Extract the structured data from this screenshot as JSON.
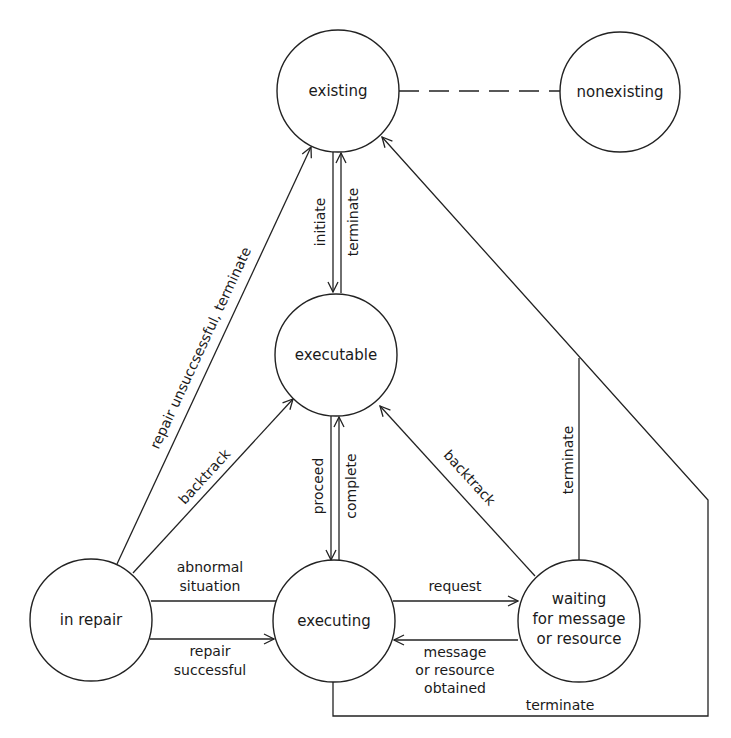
{
  "diagram": {
    "title": "",
    "colors": {
      "line": "#222222",
      "background": "#ffffff",
      "text": "#1a1a1a"
    },
    "nodes": {
      "existing": {
        "label": "existing"
      },
      "nonexisting": {
        "label": "nonexisting"
      },
      "executable": {
        "label": "executable"
      },
      "in_repair": {
        "label": "in repair"
      },
      "executing": {
        "label": "executing"
      },
      "waiting": {
        "line1": "waiting",
        "line2": "for message",
        "line3": "or resource"
      }
    },
    "edges": {
      "existing_nonexisting": {
        "style": "dashed",
        "label": ""
      },
      "initiate": {
        "from": "existing",
        "to": "executable",
        "label": "initiate"
      },
      "terminate_executable": {
        "from": "executable",
        "to": "existing",
        "label": "terminate"
      },
      "proceed": {
        "from": "executable",
        "to": "executing",
        "label": "proceed"
      },
      "complete": {
        "from": "executing",
        "to": "executable",
        "label": "complete"
      },
      "repair_unsuccessful": {
        "from": "in_repair",
        "to": "existing",
        "label": "repair unsuccsessful, terminate"
      },
      "backtrack_repair": {
        "from": "in_repair",
        "to": "executable",
        "label": "backtrack"
      },
      "backtrack_waiting": {
        "from": "waiting",
        "to": "executable",
        "label": "backtrack"
      },
      "abnormal_situation": {
        "between": [
          "executing",
          "in_repair"
        ],
        "line1": "abnormal",
        "line2": "situation"
      },
      "repair_successful": {
        "from": "in_repair",
        "to": "executing",
        "line1": "repair",
        "line2": "successful"
      },
      "request": {
        "from": "executing",
        "to": "waiting",
        "label": "request"
      },
      "message_obtained": {
        "from": "waiting",
        "to": "executing",
        "line1": "message",
        "line2": "or resource",
        "line3": "obtained"
      },
      "terminate_waiting": {
        "from": "waiting",
        "to": "existing",
        "label": "terminate"
      },
      "terminate_executing": {
        "from": "executing",
        "to": "existing",
        "label": "terminate"
      }
    }
  }
}
